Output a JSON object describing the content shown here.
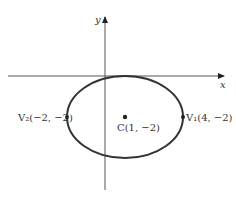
{
  "diagram": {
    "type": "ellipse-on-axes",
    "axes": {
      "x_label": "x",
      "y_label": "y"
    },
    "ellipse": {
      "center": {
        "label": "C(1, −2)",
        "x": 1,
        "y": -2
      },
      "vertex_right": {
        "label": "V₁(4, −2)",
        "x": 4,
        "y": -2
      },
      "vertex_left": {
        "label": "V₂(−2, −2)",
        "x": -2,
        "y": -2
      }
    },
    "colors": {
      "stroke": "#333333",
      "axis": "#555555",
      "background": "#ffffff"
    }
  }
}
